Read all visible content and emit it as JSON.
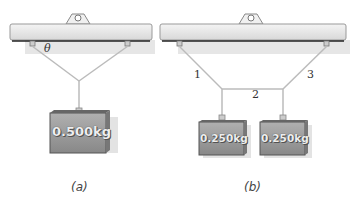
{
  "panel_a": {
    "caption": "(a)",
    "angle_label": "θ",
    "mass_label": "0.500kg"
  },
  "panel_b": {
    "caption": "(b)",
    "string_labels": [
      "1",
      "2",
      "3"
    ],
    "mass_labels": [
      "0.250kg",
      "0.250kg"
    ]
  }
}
